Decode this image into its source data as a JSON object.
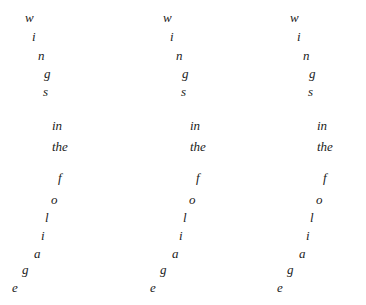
{
  "page": {
    "background_color": "#ffffff",
    "text_color": "#1b1b1b",
    "width": 366,
    "height": 305,
    "column_count": 3
  },
  "poem": {
    "full_text": "wings in the foliage",
    "stanzas": [
      {
        "name": "wings",
        "text": "wings",
        "direction": "descending-right"
      },
      {
        "name": "in-the",
        "text": "in the",
        "direction": "stacked"
      },
      {
        "name": "foliage",
        "text": "foliage",
        "direction": "descending-left"
      }
    ]
  },
  "columns": [
    {
      "id": "column-1",
      "x_offset": 0,
      "tokens": [
        {
          "text": "w",
          "x": 25,
          "y": 11
        },
        {
          "text": "i",
          "x": 32,
          "y": 30
        },
        {
          "text": "n",
          "x": 38,
          "y": 49
        },
        {
          "text": "g",
          "x": 44,
          "y": 67
        },
        {
          "text": "s",
          "x": 43,
          "y": 85
        },
        {
          "text": "in",
          "x": 52,
          "y": 119
        },
        {
          "text": "the",
          "x": 52,
          "y": 140
        },
        {
          "text": "f",
          "x": 58,
          "y": 171
        },
        {
          "text": "o",
          "x": 51,
          "y": 193
        },
        {
          "text": "l",
          "x": 45,
          "y": 211
        },
        {
          "text": "i",
          "x": 41,
          "y": 229
        },
        {
          "text": "a",
          "x": 34,
          "y": 247
        },
        {
          "text": "g",
          "x": 22,
          "y": 263
        },
        {
          "text": "e",
          "x": 12,
          "y": 281
        }
      ]
    },
    {
      "id": "column-2",
      "x_offset": 138,
      "tokens": [
        {
          "text": "w",
          "x": 25,
          "y": 11
        },
        {
          "text": "i",
          "x": 32,
          "y": 30
        },
        {
          "text": "n",
          "x": 38,
          "y": 49
        },
        {
          "text": "g",
          "x": 44,
          "y": 67
        },
        {
          "text": "s",
          "x": 43,
          "y": 85
        },
        {
          "text": "in",
          "x": 52,
          "y": 119
        },
        {
          "text": "the",
          "x": 52,
          "y": 140
        },
        {
          "text": "f",
          "x": 58,
          "y": 171
        },
        {
          "text": "o",
          "x": 51,
          "y": 193
        },
        {
          "text": "l",
          "x": 45,
          "y": 211
        },
        {
          "text": "i",
          "x": 41,
          "y": 229
        },
        {
          "text": "a",
          "x": 34,
          "y": 247
        },
        {
          "text": "g",
          "x": 22,
          "y": 263
        },
        {
          "text": "e",
          "x": 12,
          "y": 281
        }
      ]
    },
    {
      "id": "column-3",
      "x_offset": 265,
      "tokens": [
        {
          "text": "w",
          "x": 25,
          "y": 11
        },
        {
          "text": "i",
          "x": 32,
          "y": 30
        },
        {
          "text": "n",
          "x": 38,
          "y": 49
        },
        {
          "text": "g",
          "x": 44,
          "y": 67
        },
        {
          "text": "s",
          "x": 43,
          "y": 85
        },
        {
          "text": "in",
          "x": 52,
          "y": 119
        },
        {
          "text": "the",
          "x": 52,
          "y": 140
        },
        {
          "text": "f",
          "x": 58,
          "y": 171
        },
        {
          "text": "o",
          "x": 51,
          "y": 193
        },
        {
          "text": "l",
          "x": 45,
          "y": 211
        },
        {
          "text": "i",
          "x": 41,
          "y": 229
        },
        {
          "text": "a",
          "x": 34,
          "y": 247
        },
        {
          "text": "g",
          "x": 22,
          "y": 263
        },
        {
          "text": "e",
          "x": 12,
          "y": 281
        }
      ]
    }
  ]
}
